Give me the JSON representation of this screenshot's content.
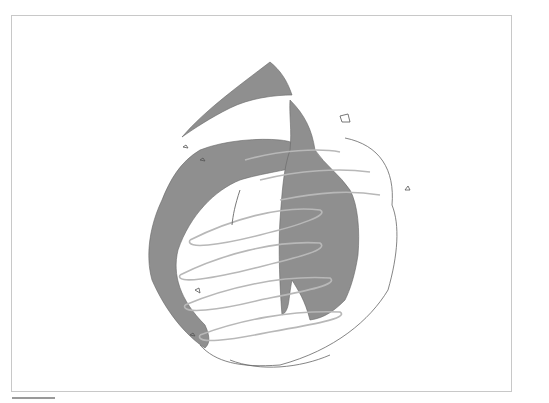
{
  "artwork": {
    "description": "Pencil sketch of an abstract flame/drop-shaped form with dark gray hatched fill and light gray looping scribbles inside a thin rectangular frame",
    "colors": {
      "background": "#ffffff",
      "frame": "#c8c8c8",
      "dark_fill": "#8f8f8f",
      "scribble": "#b8b8b8",
      "outline": "#555555",
      "underline": "#9a9a9a"
    }
  }
}
